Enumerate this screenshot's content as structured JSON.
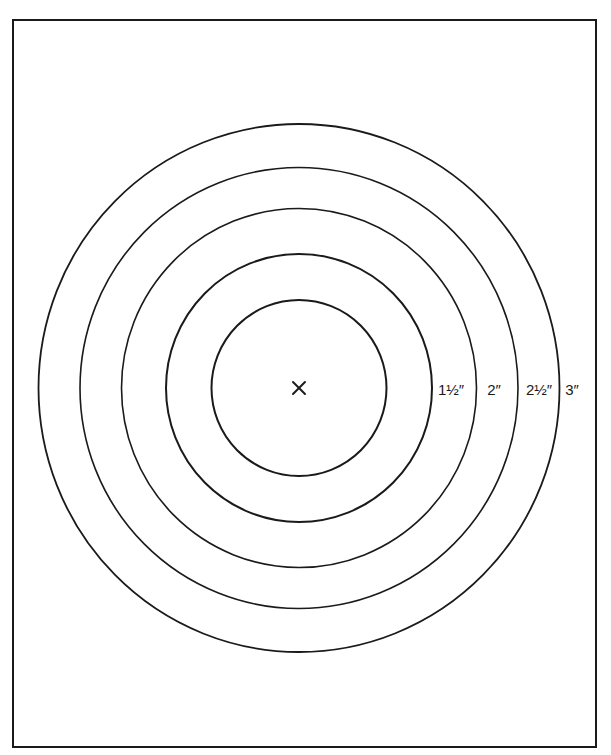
{
  "diagram": {
    "type": "concentric-circles-template",
    "frame": {
      "x": 13,
      "y": 20,
      "width": 583,
      "height": 727,
      "stroke": "#1a1a1a",
      "stroke_width": 2
    },
    "center": {
      "x": 299,
      "y": 388,
      "marker": "×",
      "marker_name": "center-mark-icon"
    },
    "stroke_color": "#1a1a1a",
    "circles": [
      {
        "id": "circle-1",
        "rx": 87.5,
        "ry": 88,
        "stroke_width": 2,
        "label": ""
      },
      {
        "id": "circle-1-5",
        "rx": 133,
        "ry": 134,
        "stroke_width": 2,
        "label": "1½″",
        "label_x": 451
      },
      {
        "id": "circle-2",
        "rx": 177.5,
        "ry": 179.5,
        "stroke_width": 1.6,
        "label": "2″",
        "label_x": 494
      },
      {
        "id": "circle-2-5",
        "rx": 219,
        "ry": 220.5,
        "stroke_width": 1.6,
        "label": "2½″",
        "label_x": 539
      },
      {
        "id": "circle-3",
        "rx": 260.5,
        "ry": 264,
        "stroke_width": 1.8,
        "label": "3″",
        "label_x": 572
      }
    ],
    "labels": [
      "1½″",
      "2″",
      "2½″",
      "3″"
    ]
  }
}
